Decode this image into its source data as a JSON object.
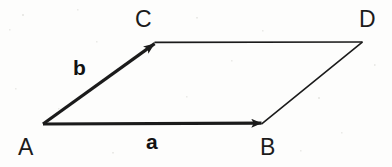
{
  "figure": {
    "kind": "vector-parallelogram-diagram",
    "width": 392,
    "height": 167,
    "background_color": "#fdfdfc",
    "stroke_color": "#1b1b1b",
    "label_color": "#1b1b1b"
  },
  "vertices": [
    {
      "id": "A",
      "label": "A",
      "x": 43,
      "y": 124,
      "label_x": 18,
      "label_y": 136
    },
    {
      "id": "B",
      "label": "B",
      "x": 262,
      "y": 123,
      "label_x": 260,
      "label_y": 136
    },
    {
      "id": "C",
      "label": "C",
      "x": 155,
      "y": 43,
      "label_x": 135,
      "label_y": 8
    },
    {
      "id": "D",
      "label": "D",
      "x": 362,
      "y": 42,
      "label_x": 359,
      "label_y": 8
    }
  ],
  "vectors": [
    {
      "id": "a",
      "label": "a",
      "from": "A",
      "to": "B",
      "arrowhead": true,
      "stroke_width": 3.2,
      "label_x": 146,
      "label_y": 131
    },
    {
      "id": "b",
      "label": "b",
      "from": "A",
      "to": "C",
      "arrowhead": true,
      "stroke_width": 3.2,
      "label_x": 73,
      "label_y": 57
    }
  ],
  "edges": [
    {
      "id": "CD",
      "from": "C",
      "to": "D",
      "arrowhead": false,
      "stroke_width": 1.6
    },
    {
      "id": "BD",
      "from": "B",
      "to": "D",
      "arrowhead": false,
      "stroke_width": 1.6
    }
  ]
}
